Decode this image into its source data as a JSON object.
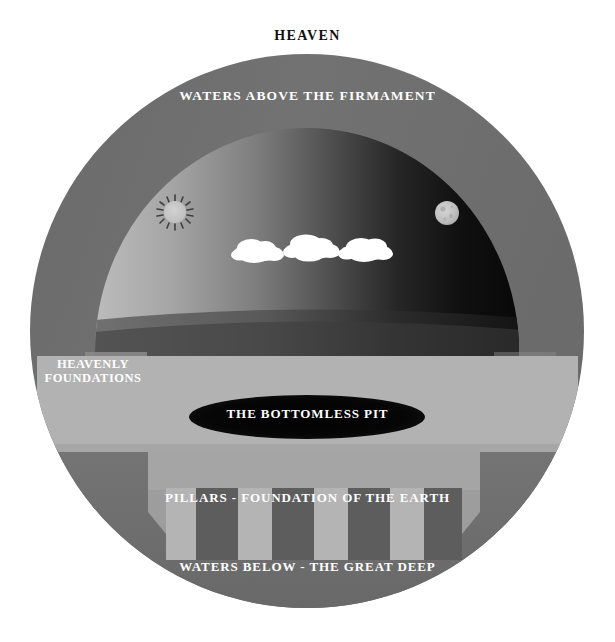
{
  "figure": {
    "canvas": {
      "width": 615,
      "height": 642,
      "background": "#ffffff"
    }
  },
  "labels": {
    "heaven": "HEAVEN",
    "waters_above": "WATERS ABOVE THE FIRMAMENT",
    "heavenly_foundations": "HEAVENLY FOUNDATIONS",
    "bottomless_pit": "THE BOTTOMLESS PIT",
    "pillars": "PILLARS - FOUNDATION OF THE EARTH",
    "waters_below": "WATERS BELOW - THE GREAT DEEP"
  },
  "colors": {
    "page_background": "#ffffff",
    "heaven_text": "#111111",
    "label_text": "#ffffff",
    "outer_ring": "#6e6e6e",
    "outer_ring_shade": "#7a7a7a",
    "sky_light": "#b4b4b4",
    "sky_dark": "#0d0d0d",
    "sky_floor_band": "#4a4a4a",
    "earth_band": "#b0b0b0",
    "pillar_block": "#9a9a9a",
    "pillar_slot": "#5f5f5f",
    "foundation_block": "#8a8a8a",
    "foundation_slot": "#4f4f4f",
    "deep_water": "#6b6b6b",
    "pit_fill": "#080808",
    "sun_body": "#c9c9c9",
    "sun_ray": "#3a3a3a",
    "moon_body": "#c4c4c4",
    "moon_crater": "#a8a8a8",
    "cloud": "#ffffff"
  },
  "geometry": {
    "circle": {
      "cx": 307,
      "cy": 331,
      "r": 277
    },
    "dome": {
      "cx": 307,
      "cy": 352,
      "rx": 212,
      "ry": 224
    },
    "earth_band": {
      "x": 37,
      "y": 356,
      "width": 541,
      "height": 94
    },
    "pit_ellipse": {
      "cx": 307,
      "cy": 417,
      "rx": 118,
      "ry": 22
    },
    "sun": {
      "cx": 175,
      "cy": 212,
      "r": 11,
      "rays": 14
    },
    "moon": {
      "cx": 447,
      "cy": 213,
      "r": 12
    },
    "clouds": [
      {
        "cx": 258,
        "cy": 253,
        "scale": 1.0
      },
      {
        "cx": 312,
        "cy": 250,
        "scale": 1.05
      },
      {
        "cx": 366,
        "cy": 252,
        "scale": 1.0
      }
    ],
    "left_pillar_block": {
      "x": 85,
      "y": 352,
      "width": 62,
      "height": 68
    },
    "right_pillar_block": {
      "x": 494,
      "y": 352,
      "width": 62,
      "height": 68
    },
    "foundation_block": {
      "x": 148,
      "y": 450,
      "width": 332,
      "height": 98
    }
  },
  "elements": {
    "sun_name": "sun-icon",
    "moon_name": "moon-icon",
    "cloud_name": "cloud-icon"
  }
}
